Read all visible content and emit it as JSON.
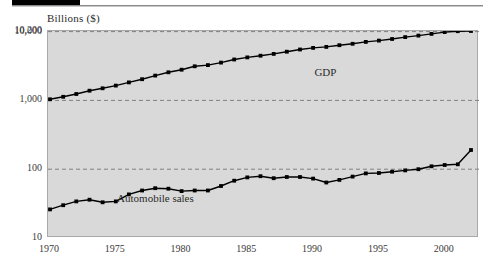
{
  "decoration": {
    "black_bar": "",
    "rule": ""
  },
  "chart_data": {
    "type": "line",
    "title": "Billions ($)",
    "xlabel": "",
    "ylabel": "Billions ($)",
    "yscale": "log",
    "ylim": [
      10,
      10200
    ],
    "xlim": [
      1970,
      2002
    ],
    "grid": true,
    "grid_style": "dashed horizontal at 100, 1,000, 10,000",
    "legend": "inline data labels",
    "y_tick_labels": [
      "10,200",
      "10,000",
      "1,000",
      "100",
      "10"
    ],
    "y_tick_values": [
      10200,
      10000,
      1000,
      100,
      10
    ],
    "x_tick_labels": [
      "1970",
      "1975",
      "1980",
      "1985",
      "1990",
      "1995",
      "2000"
    ],
    "x_tick_values": [
      1970,
      1975,
      1980,
      1985,
      1990,
      1995,
      2000
    ],
    "x": [
      1970,
      1971,
      1972,
      1973,
      1974,
      1975,
      1976,
      1977,
      1978,
      1979,
      1980,
      1981,
      1982,
      1983,
      1984,
      1985,
      1986,
      1987,
      1988,
      1989,
      1990,
      1991,
      1992,
      1993,
      1994,
      1995,
      1996,
      1997,
      1998,
      1999,
      2000,
      2001,
      2002
    ],
    "series": [
      {
        "name": "GDP",
        "label": "GDP",
        "color": "#000000",
        "marker": "square",
        "values": [
          1038,
          1127,
          1238,
          1383,
          1500,
          1638,
          1825,
          2031,
          2294,
          2563,
          2790,
          3128,
          3255,
          3537,
          3933,
          4220,
          4463,
          4740,
          5104,
          5484,
          5803,
          5996,
          6338,
          6657,
          7072,
          7398,
          7817,
          8304,
          8747,
          9268,
          9817,
          10128,
          10200
        ]
      },
      {
        "name": "Automobile sales",
        "label": "Automobile sales",
        "color": "#000000",
        "marker": "square",
        "values": [
          26,
          30,
          34,
          36,
          33,
          34,
          43,
          49,
          53,
          52,
          48,
          49,
          49,
          57,
          68,
          76,
          79,
          74,
          77,
          77,
          73,
          64,
          70,
          78,
          87,
          88,
          92,
          96,
          100,
          110,
          115,
          118,
          190
        ]
      }
    ],
    "annotations": [
      {
        "text": "GDP",
        "x": 1992,
        "y": 2450
      },
      {
        "text": "Automobile sales",
        "x": 1977,
        "y": 36
      }
    ]
  }
}
